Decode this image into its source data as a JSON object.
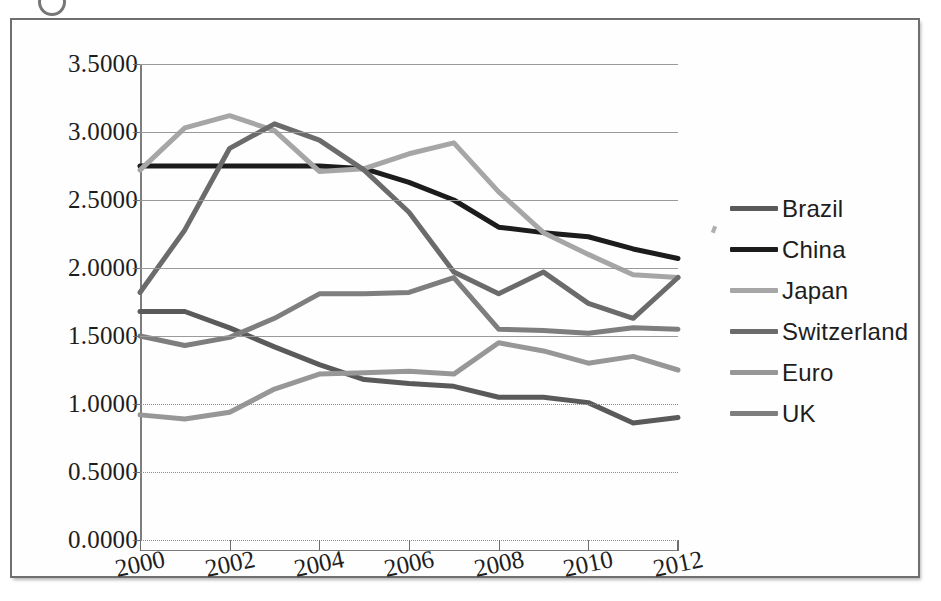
{
  "chart_data": {
    "type": "line",
    "title": "",
    "xlabel": "",
    "ylabel": "",
    "x": [
      2000,
      2001,
      2002,
      2003,
      2004,
      2005,
      2006,
      2007,
      2008,
      2009,
      2010,
      2011,
      2012
    ],
    "xlim": [
      2000,
      2012
    ],
    "ylim": [
      0.0,
      3.5
    ],
    "ytick_labels": [
      "3.5000",
      "3.0000",
      "2.5000",
      "2.0000",
      "1.5000",
      "1.0000",
      "0.5000",
      "0.0000"
    ],
    "ytick_values": [
      3.5,
      3.0,
      2.5,
      2.0,
      1.5,
      1.0,
      0.5,
      0.0
    ],
    "xtick_labels": [
      "2000",
      "2002",
      "2004",
      "2006",
      "2008",
      "2010",
      "2012"
    ],
    "xtick_values": [
      2000,
      2002,
      2004,
      2006,
      2008,
      2010,
      2012
    ],
    "grid": true,
    "legend_position": "right",
    "series": [
      {
        "name": "Brazil",
        "color": "#5a5a5a",
        "values": [
          1.68,
          1.68,
          1.56,
          1.42,
          1.29,
          1.18,
          1.15,
          1.13,
          1.05,
          1.05,
          1.01,
          0.86,
          0.9
        ]
      },
      {
        "name": "China",
        "color": "#1c1c1c",
        "values": [
          2.75,
          2.75,
          2.75,
          2.75,
          2.75,
          2.73,
          2.63,
          2.5,
          2.3,
          2.26,
          2.23,
          2.14,
          2.07
        ]
      },
      {
        "name": "Japan",
        "color": "#a6a6a6",
        "values": [
          2.72,
          3.03,
          3.12,
          3.01,
          2.71,
          2.73,
          2.84,
          2.92,
          2.56,
          2.26,
          2.1,
          1.95,
          1.93
        ]
      },
      {
        "name": "Switzerland",
        "color": "#6b6b6b",
        "values": [
          1.82,
          2.28,
          2.88,
          3.06,
          2.94,
          2.72,
          2.41,
          1.97,
          1.81,
          1.97,
          1.74,
          1.63,
          1.93
        ]
      },
      {
        "name": "Euro",
        "color": "#979797",
        "values": [
          0.92,
          0.89,
          0.94,
          1.11,
          1.22,
          1.23,
          1.24,
          1.22,
          1.45,
          1.39,
          1.3,
          1.35,
          1.25
        ]
      },
      {
        "name": "UK",
        "color": "#7e7e7e",
        "values": [
          1.5,
          1.43,
          1.49,
          1.63,
          1.81,
          1.81,
          1.82,
          1.93,
          1.55,
          1.54,
          1.52,
          1.56,
          1.55
        ]
      }
    ]
  },
  "legend": {
    "items": [
      {
        "label": "Brazil"
      },
      {
        "label": "China"
      },
      {
        "label": "Japan"
      },
      {
        "label": "Switzerland"
      },
      {
        "label": "Euro"
      },
      {
        "label": "UK"
      }
    ]
  }
}
